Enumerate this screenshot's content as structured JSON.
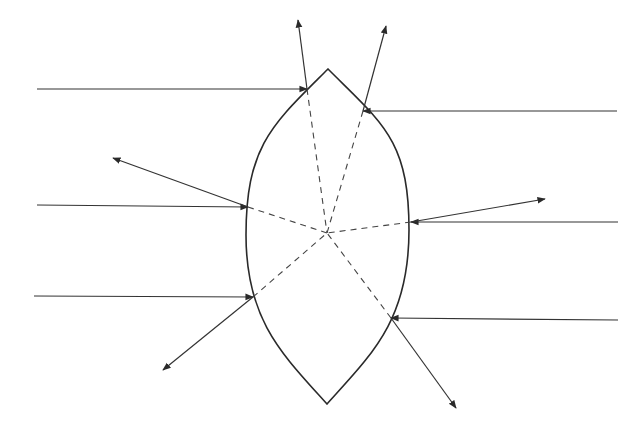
{
  "diagram": {
    "type": "ray-reflection",
    "colors": {
      "background": "#ffffff",
      "line": "#333333",
      "normal": "#444444"
    },
    "lens": {
      "top_tip": [
        328,
        69
      ],
      "bottom_tip": [
        327,
        404
      ],
      "left_extreme": [
        246,
        235
      ],
      "right_extreme": [
        409,
        230
      ]
    },
    "center": [
      327,
      233
    ],
    "rays": [
      {
        "id": "left-1",
        "side": "left",
        "start": [
          37,
          89
        ],
        "contact": [
          307,
          89
        ],
        "reflected_tip": [
          298,
          20
        ]
      },
      {
        "id": "left-2",
        "side": "left",
        "start": [
          37,
          205
        ],
        "contact": [
          248,
          207
        ],
        "reflected_tip": [
          113,
          158
        ]
      },
      {
        "id": "left-3",
        "side": "left",
        "start": [
          34,
          296
        ],
        "contact": [
          253,
          297
        ],
        "reflected_tip": [
          163,
          370
        ]
      },
      {
        "id": "right-1",
        "side": "right",
        "start": [
          617,
          111
        ],
        "contact": [
          363,
          111
        ],
        "reflected_tip": [
          386,
          26
        ]
      },
      {
        "id": "right-2",
        "side": "right",
        "start": [
          618,
          222
        ],
        "contact": [
          411,
          222
        ],
        "reflected_tip": [
          545,
          199
        ]
      },
      {
        "id": "right-3",
        "side": "right",
        "start": [
          618,
          320
        ],
        "contact": [
          391,
          318
        ],
        "reflected_tip": [
          456,
          408
        ]
      }
    ]
  }
}
